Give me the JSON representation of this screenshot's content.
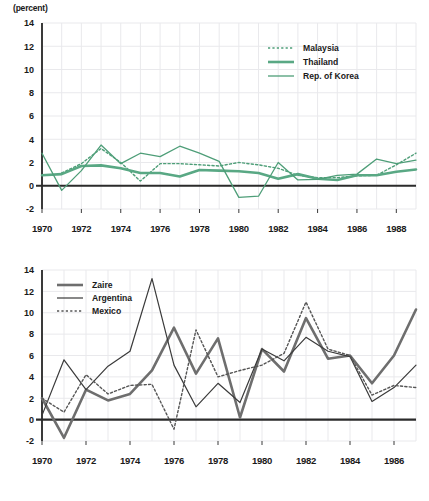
{
  "charts": [
    {
      "id": "chart-top",
      "unit_label": "(percent)",
      "chart_type": "line",
      "ylim": [
        -2,
        14
      ],
      "yticks": [
        "-2",
        "0",
        "2",
        "4",
        "6",
        "8",
        "10",
        "12",
        "14"
      ],
      "ytick_values": [
        -2,
        0,
        2,
        4,
        6,
        8,
        10,
        12,
        14
      ],
      "xlim": [
        1970,
        1989
      ],
      "xticks": [
        "1970",
        "1972",
        "1974",
        "1976",
        "1978",
        "1980",
        "1982",
        "1984",
        "1986",
        "1988"
      ],
      "xtick_values": [
        1970,
        1972,
        1974,
        1976,
        1978,
        1980,
        1982,
        1984,
        1986,
        1988
      ],
      "legend_position": "top-right",
      "grid": true,
      "series": [
        {
          "name": "Malaysia",
          "style": "dotted",
          "color": "#4e9e78",
          "width": 1.4,
          "values": [
            null,
            1.1,
            1.9,
            3.2,
            2.0,
            0.4,
            1.9,
            1.9,
            1.8,
            1.7,
            2.0,
            1.8,
            1.5,
            0.9,
            0.7,
            0.7,
            0.85,
            0.9,
            1.8,
            2.8
          ]
        },
        {
          "name": "Thailand",
          "style": "solid-thick",
          "color": "#59a884",
          "width": 2.6,
          "values": [
            0.9,
            1.0,
            1.7,
            1.75,
            1.5,
            1.1,
            1.1,
            0.8,
            1.35,
            1.3,
            1.25,
            1.1,
            0.6,
            1.0,
            0.6,
            0.5,
            0.9,
            0.9,
            1.2,
            1.4
          ]
        },
        {
          "name": "Rep. of Korea",
          "style": "solid-thin",
          "color": "#4e9e78",
          "width": 1.3,
          "values": [
            2.8,
            -0.4,
            1.3,
            3.5,
            1.9,
            2.8,
            2.5,
            3.4,
            2.8,
            2.1,
            -1.0,
            -0.9,
            2.0,
            0.5,
            0.55,
            0.9,
            1.0,
            2.3,
            1.9,
            2.2
          ]
        }
      ]
    },
    {
      "id": "chart-bottom",
      "unit_label": "",
      "chart_type": "line",
      "ylim": [
        -2,
        14
      ],
      "yticks": [
        "-2",
        "0",
        "2",
        "4",
        "6",
        "8",
        "10",
        "12",
        "14"
      ],
      "ytick_values": [
        -2,
        0,
        2,
        4,
        6,
        8,
        10,
        12,
        14
      ],
      "xlim": [
        1970,
        1987
      ],
      "xticks": [
        "1970",
        "1972",
        "1974",
        "1976",
        "1978",
        "1980",
        "1982",
        "1984",
        "1986"
      ],
      "xtick_values": [
        1970,
        1972,
        1974,
        1976,
        1978,
        1980,
        1982,
        1984,
        1986
      ],
      "legend_position": "top-left",
      "grid": true,
      "series": [
        {
          "name": "Zaire",
          "style": "solid-thick",
          "color": "#6e6e6e",
          "width": 2.6,
          "values": [
            2.0,
            -1.7,
            2.8,
            1.8,
            2.4,
            4.6,
            8.6,
            4.3,
            7.6,
            0.2,
            6.6,
            4.5,
            9.5,
            5.7,
            6.0,
            3.4,
            6.0,
            10.3
          ]
        },
        {
          "name": "Argentina",
          "style": "solid-thin",
          "color": "#3a3a3a",
          "width": 1.2,
          "values": [
            0.4,
            5.6,
            2.8,
            5.0,
            6.4,
            13.2,
            5.1,
            1.2,
            3.4,
            1.6,
            6.6,
            5.5,
            7.7,
            6.4,
            5.9,
            1.7,
            3.0,
            5.1
          ]
        },
        {
          "name": "Mexico",
          "style": "dotted",
          "color": "#555555",
          "width": 1.4,
          "values": [
            2.0,
            0.7,
            4.2,
            2.4,
            3.2,
            3.3,
            -0.9,
            8.4,
            4.0,
            4.6,
            5.1,
            6.2,
            11.0,
            6.6,
            6.0,
            2.3,
            3.2,
            3.0
          ]
        }
      ]
    }
  ]
}
